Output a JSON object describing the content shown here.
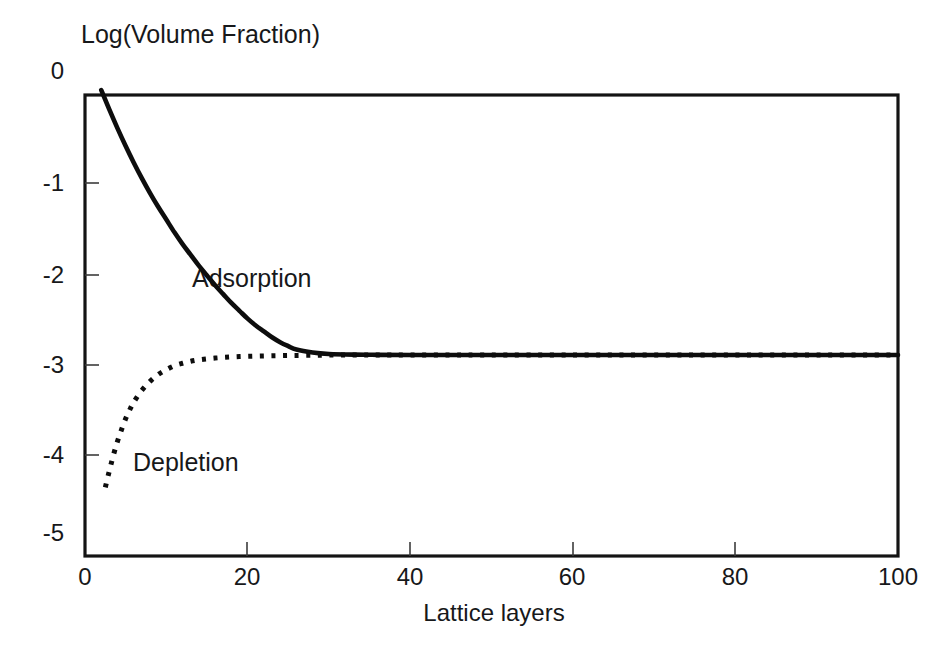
{
  "chart_data": {
    "type": "line",
    "title": "",
    "xlabel": "Lattice layers",
    "ylabel": "Log(Volume Fraction)",
    "xlim": [
      0,
      100
    ],
    "ylim": [
      -5.25,
      -0.55
    ],
    "xticks": [
      "0",
      "20",
      "40",
      "60",
      "80",
      "100"
    ],
    "xtick_values": [
      0,
      20,
      40,
      60,
      80,
      100
    ],
    "yticks": [
      "0",
      "-1",
      "-2",
      "-3",
      "-4",
      "-5"
    ],
    "ytick_values": [
      0,
      -1,
      -2,
      -3,
      -4,
      -5
    ],
    "grid": false,
    "legend_position": "inline-annotations",
    "plateau_value": -3.2,
    "series": [
      {
        "name": "Adsorption",
        "style": "solid",
        "color": "#0d0d0d",
        "annotation": "Adsorption",
        "x": [
          2,
          3,
          4,
          5,
          6,
          7,
          8,
          9,
          10,
          11,
          12,
          13,
          14,
          15,
          16,
          17,
          18,
          19,
          20,
          21,
          22,
          23,
          24,
          25,
          26,
          28,
          30,
          33,
          36,
          40,
          45,
          50,
          60,
          70,
          80,
          90,
          100
        ],
        "y": [
          -0.5,
          -0.7,
          -0.89,
          -1.07,
          -1.24,
          -1.4,
          -1.55,
          -1.69,
          -1.82,
          -1.95,
          -2.07,
          -2.18,
          -2.29,
          -2.39,
          -2.49,
          -2.58,
          -2.67,
          -2.75,
          -2.83,
          -2.9,
          -2.96,
          -3.02,
          -3.07,
          -3.11,
          -3.145,
          -3.175,
          -3.19,
          -3.197,
          -3.199,
          -3.2,
          -3.2,
          -3.2,
          -3.2,
          -3.2,
          -3.2,
          -3.2,
          -3.2
        ]
      },
      {
        "name": "Depletion",
        "style": "dotted",
        "color": "#0d0d0d",
        "annotation": "Depletion",
        "x": [
          2.5,
          3,
          3.5,
          4,
          4.5,
          5,
          5.5,
          6,
          7,
          8,
          9,
          10,
          11,
          12,
          13,
          14,
          15,
          16,
          17,
          18,
          19,
          20,
          21,
          22,
          23,
          24,
          25,
          26,
          28,
          30,
          33,
          36,
          40,
          45,
          50,
          60,
          70,
          80,
          90,
          100
        ],
        "y": [
          -4.55,
          -4.38,
          -4.22,
          -4.08,
          -3.96,
          -3.85,
          -3.76,
          -3.68,
          -3.56,
          -3.47,
          -3.4,
          -3.35,
          -3.31,
          -3.285,
          -3.265,
          -3.25,
          -3.24,
          -3.232,
          -3.226,
          -3.221,
          -3.217,
          -3.214,
          -3.212,
          -3.21,
          -3.208,
          -3.207,
          -3.206,
          -3.205,
          -3.203,
          -3.202,
          -3.201,
          -3.2,
          -3.2,
          -3.2,
          -3.2,
          -3.2,
          -3.2,
          -3.2,
          -3.2,
          -3.2
        ]
      }
    ]
  },
  "figure": {
    "background_color": "#ffffff",
    "axis_color": "#141414"
  }
}
